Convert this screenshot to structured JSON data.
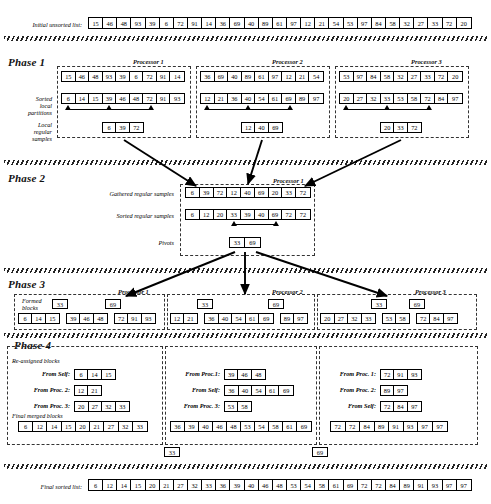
{
  "figure": {
    "initial_label": "Initial unsorted list:",
    "final_label": "Final sorted list:",
    "initial_list": [
      15,
      46,
      48,
      93,
      39,
      6,
      72,
      91,
      14,
      36,
      69,
      40,
      89,
      61,
      97,
      12,
      21,
      54,
      53,
      97,
      84,
      58,
      32,
      27,
      33,
      72,
      20
    ],
    "final_list": [
      6,
      12,
      14,
      15,
      20,
      21,
      27,
      32,
      33,
      36,
      39,
      40,
      46,
      48,
      53,
      54,
      58,
      61,
      69,
      72,
      72,
      84,
      89,
      91,
      93,
      97,
      97
    ]
  },
  "phase1": {
    "heading": "Phase 1",
    "labels": {
      "sorted_local": "Sorted\nlocal\npartitions",
      "local_samples": "Local\nregular\nsamples"
    },
    "processors": [
      {
        "title": "Processor 1",
        "unsorted": [
          15,
          46,
          48,
          93,
          39,
          6,
          72,
          91,
          14
        ],
        "sorted": [
          6,
          14,
          15,
          39,
          46,
          48,
          72,
          91,
          93
        ],
        "samples": [
          6,
          39,
          72
        ],
        "sample_indices": [
          0,
          3,
          6
        ]
      },
      {
        "title": "Processor 2",
        "unsorted": [
          36,
          69,
          40,
          89,
          61,
          97,
          12,
          21,
          54
        ],
        "sorted": [
          12,
          21,
          36,
          40,
          54,
          61,
          69,
          89,
          97
        ],
        "samples": [
          12,
          40,
          69
        ],
        "sample_indices": [
          0,
          3,
          6
        ]
      },
      {
        "title": "Processor 3",
        "unsorted": [
          53,
          97,
          84,
          58,
          32,
          27,
          33,
          72,
          20
        ],
        "sorted": [
          20,
          27,
          32,
          33,
          53,
          58,
          72,
          84,
          97
        ],
        "samples": [
          20,
          33,
          72
        ],
        "sample_indices": [
          0,
          3,
          6
        ]
      }
    ]
  },
  "phase2": {
    "heading": "Phase 2",
    "processor_title": "Processor 1",
    "labels": {
      "gathered": "Gathered regular samples",
      "sorted": "Sorted regular samples",
      "pivots": "Pivots"
    },
    "gathered_samples": [
      6,
      39,
      72,
      12,
      40,
      69,
      20,
      33,
      72
    ],
    "sorted_samples": [
      6,
      12,
      20,
      33,
      39,
      40,
      69,
      72,
      72
    ],
    "pivot_indices": [
      3,
      6
    ],
    "pivots": [
      33,
      69
    ]
  },
  "phase3": {
    "heading": "Phase 3",
    "label_formed": "Formed\nblocks",
    "pivot_markers": [
      33,
      69
    ],
    "processors": [
      {
        "title": "Processor 1",
        "blocks": [
          [
            6,
            14,
            15
          ],
          [
            39,
            46,
            48
          ],
          [
            72,
            91,
            93
          ]
        ]
      },
      {
        "title": "Processor 2",
        "blocks": [
          [
            12,
            21
          ],
          [
            36,
            40,
            54,
            61,
            69
          ],
          [
            89,
            97
          ]
        ]
      },
      {
        "title": "Processor 3",
        "blocks": [
          [
            20,
            27,
            32,
            33
          ],
          [
            53,
            58
          ],
          [
            72,
            84,
            97
          ]
        ]
      }
    ]
  },
  "phase4": {
    "heading": "Phase 4",
    "label_reassigned": "Re-assigned blocks",
    "label_merged": "Final merged blocks",
    "pivot_markers": [
      33,
      69
    ],
    "processors": [
      {
        "rows": [
          {
            "label": "From Self:",
            "values": [
              6,
              14,
              15
            ]
          },
          {
            "label": "From Proc. 2:",
            "values": [
              12,
              21
            ]
          },
          {
            "label": "From Proc. 3:",
            "values": [
              20,
              27,
              32,
              33
            ]
          }
        ],
        "merged": [
          6,
          12,
          14,
          15,
          20,
          21,
          27,
          32,
          33
        ]
      },
      {
        "rows": [
          {
            "label": "From Proc.1:",
            "values": [
              39,
              46,
              48
            ]
          },
          {
            "label": "From Self:",
            "values": [
              36,
              40,
              54,
              61,
              69
            ]
          },
          {
            "label": "From Proc. 3:",
            "values": [
              53,
              58
            ]
          }
        ],
        "merged": [
          36,
          39,
          40,
          46,
          48,
          53,
          54,
          58,
          61,
          69
        ]
      },
      {
        "rows": [
          {
            "label": "From Proc. 1:",
            "values": [
              72,
              91,
              93
            ]
          },
          {
            "label": "From Proc. 2:",
            "values": [
              89,
              97
            ]
          },
          {
            "label": "From Self:",
            "values": [
              72,
              84,
              97
            ]
          }
        ],
        "merged": [
          72,
          72,
          84,
          89,
          91,
          93,
          97,
          97
        ]
      }
    ]
  },
  "colors": {
    "ink": "#000000",
    "dash": "#333333",
    "paper": "#ffffff"
  }
}
